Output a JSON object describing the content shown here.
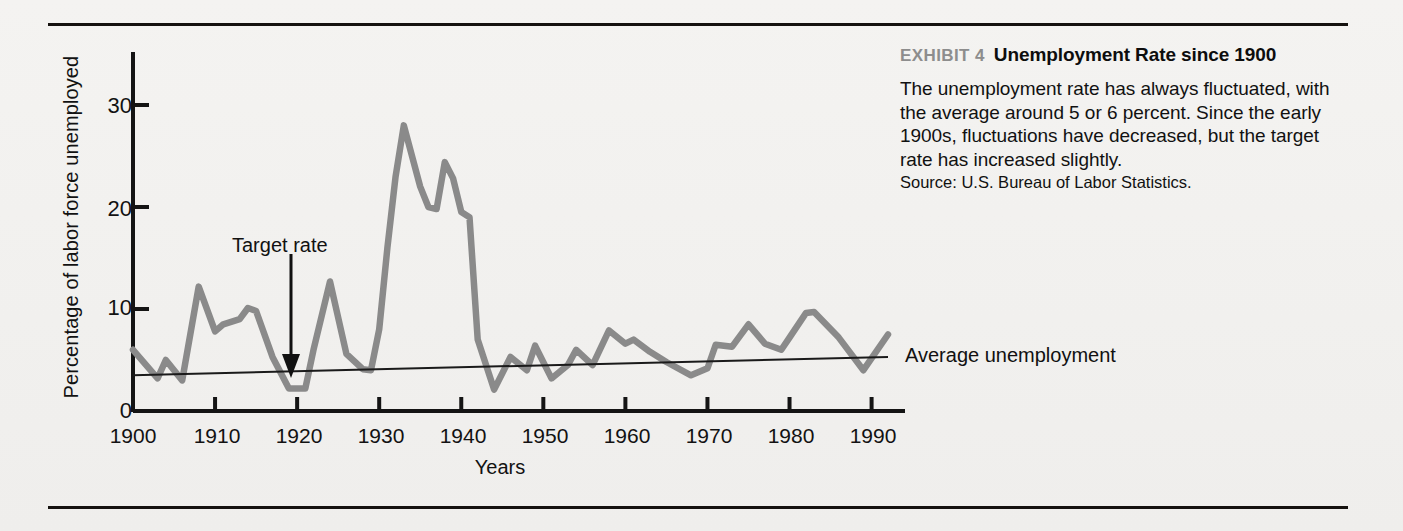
{
  "exhibit": {
    "kicker": "EXHIBIT 4",
    "title": "Unemployment Rate since 1900",
    "body": "The unemployment rate has always fluctuated, with the average around 5 or 6 percent. Since the early 1900s, fluctuations have decreased, but the target rate has increased slightly.",
    "source": "Source: U.S. Bureau of Labor Statistics."
  },
  "annotations": {
    "target_rate": "Target rate",
    "average_unemployment": "Average unemployment"
  },
  "colors": {
    "series_line": "#8a8a8a",
    "average_line": "#1a1a1a",
    "axis": "#141414",
    "background": "#f1f0ee"
  },
  "chart_data": {
    "type": "line",
    "title": "Unemployment Rate since 1900",
    "xlabel": "Years",
    "ylabel": "Percentage of labor force unemployed",
    "xlim": [
      1900,
      1992
    ],
    "ylim": [
      0,
      34
    ],
    "xticks": [
      1900,
      1910,
      1920,
      1930,
      1940,
      1950,
      1960,
      1970,
      1980,
      1990
    ],
    "yticks": [
      0,
      10,
      20,
      30
    ],
    "grid": false,
    "legend": "none",
    "series": [
      {
        "name": "Unemployment rate",
        "color": "#8a8a8a",
        "x": [
          1900,
          1903,
          1904,
          1906,
          1908,
          1910,
          1911,
          1913,
          1914,
          1915,
          1917,
          1919,
          1921,
          1922,
          1924,
          1926,
          1928,
          1929,
          1930,
          1931,
          1932,
          1933,
          1935,
          1936,
          1937,
          1938,
          1939,
          1940,
          1941,
          1942,
          1944,
          1946,
          1948,
          1949,
          1951,
          1953,
          1954,
          1956,
          1958,
          1960,
          1961,
          1963,
          1965,
          1968,
          1970,
          1971,
          1973,
          1975,
          1977,
          1979,
          1980,
          1982,
          1983,
          1986,
          1989,
          1992
        ],
        "y": [
          6.0,
          3.2,
          5.0,
          3.0,
          12.2,
          7.8,
          8.5,
          9.0,
          10.1,
          9.8,
          5.3,
          2.2,
          2.2,
          6.0,
          12.7,
          5.6,
          4.1,
          4.0,
          8.0,
          16.0,
          23.0,
          28.0,
          22.0,
          20.0,
          19.8,
          24.4,
          22.8,
          19.5,
          19.0,
          7.0,
          2.1,
          5.3,
          4.0,
          6.4,
          3.2,
          4.5,
          6.0,
          4.5,
          7.9,
          6.6,
          7.0,
          5.8,
          4.8,
          3.5,
          4.2,
          6.5,
          6.3,
          8.5,
          6.6,
          6.0,
          7.2,
          9.6,
          9.7,
          7.2,
          4.0,
          7.5
        ]
      },
      {
        "name": "Average unemployment",
        "color": "#1a1a1a",
        "x": [
          1900,
          1992
        ],
        "y": [
          3.5,
          5.3
        ]
      }
    ]
  }
}
